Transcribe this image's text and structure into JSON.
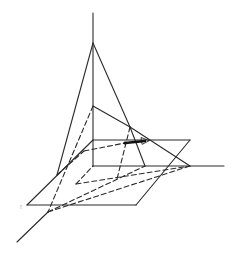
{
  "figure": {
    "type": "3D geometry diagram",
    "stroke_color": "#2a2a2a",
    "background": "#ffffff"
  },
  "labels": {
    "corner_mark": "r"
  }
}
